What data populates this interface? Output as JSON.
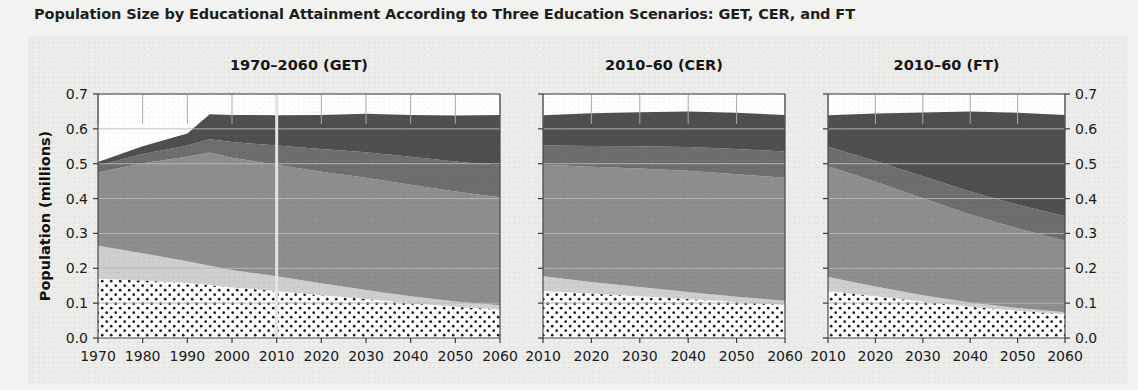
{
  "figure": {
    "title": "Population Size by Educational Attainment According to Three Education Scenarios: GET, CER, and FT"
  },
  "axes": {
    "ylabel": "Population (millions)",
    "ytick_labels": [
      "0.0",
      "0.1",
      "0.2",
      "0.3",
      "0.4",
      "0.5",
      "0.6",
      "0.7"
    ],
    "ytick_values": [
      0.0,
      0.1,
      0.2,
      0.3,
      0.4,
      0.5,
      0.6,
      0.7
    ],
    "panel1_xticks": [
      "1970",
      "1980",
      "1990",
      "2000",
      "2010",
      "2020",
      "2030",
      "2040",
      "2050",
      "2060"
    ],
    "panel2_xticks": [
      "2010",
      "2020",
      "2030",
      "2040",
      "2050",
      "2060"
    ],
    "panel3_xticks": [
      "2010",
      "2020",
      "2030",
      "2040",
      "2050",
      "2060"
    ]
  },
  "chart_data": {
    "type": "area",
    "title": "Population Size by Educational Attainment According to Three Education Scenarios: GET, CER, and FT",
    "xlabel": "",
    "ylabel": "Population (millions)",
    "ylim": [
      0.0,
      0.7
    ],
    "grid": true,
    "stacked": true,
    "legend_position": "none",
    "series_names": [
      "No education",
      "Primary",
      "Secondary",
      "Post-secondary",
      "Tertiary"
    ],
    "series_colors": [
      "#ffffff",
      "#cfcfcf",
      "#8e8e8e",
      "#6e6e6e",
      "#4f4f4f"
    ],
    "panels": [
      {
        "name": "panel-get",
        "title": "1970–2060 (GET)",
        "xlim": [
          1970,
          2060
        ],
        "reference_line_x": 2010,
        "x": [
          1970,
          1980,
          1990,
          1995,
          2000,
          2010,
          2020,
          2030,
          2040,
          2050,
          2060
        ],
        "series": [
          {
            "name": "No education",
            "values": [
              0.17,
              0.165,
              0.158,
              0.152,
              0.145,
              0.135,
              0.123,
              0.112,
              0.1,
              0.09,
              0.082
            ]
          },
          {
            "name": "Primary",
            "values": [
              0.095,
              0.078,
              0.062,
              0.055,
              0.05,
              0.042,
              0.034,
              0.026,
              0.02,
              0.015,
              0.012
            ]
          },
          {
            "name": "Secondary",
            "values": [
              0.21,
              0.258,
              0.3,
              0.325,
              0.322,
              0.32,
              0.32,
              0.322,
              0.32,
              0.315,
              0.31
            ]
          },
          {
            "name": "Post-secondary",
            "values": [
              0.02,
              0.027,
              0.032,
              0.038,
              0.045,
              0.055,
              0.065,
              0.073,
              0.08,
              0.086,
              0.09
            ]
          },
          {
            "name": "Tertiary",
            "values": [
              0.01,
              0.022,
              0.035,
              0.072,
              0.078,
              0.087,
              0.098,
              0.11,
              0.12,
              0.132,
              0.146
            ]
          }
        ],
        "totals": [
          0.505,
          0.55,
          0.587,
          0.642,
          0.64,
          0.639,
          0.64,
          0.643,
          0.64,
          0.638,
          0.64
        ]
      },
      {
        "name": "panel-cer",
        "title": "2010–60 (CER)",
        "xlim": [
          2010,
          2060
        ],
        "x": [
          2010,
          2020,
          2030,
          2040,
          2050,
          2060
        ],
        "series": [
          {
            "name": "No education",
            "values": [
              0.135,
              0.128,
              0.12,
              0.112,
              0.103,
              0.095
            ]
          },
          {
            "name": "Primary",
            "values": [
              0.042,
              0.033,
              0.026,
              0.02,
              0.015,
              0.012
            ]
          },
          {
            "name": "Secondary",
            "values": [
              0.32,
              0.33,
              0.34,
              0.348,
              0.352,
              0.353
            ]
          },
          {
            "name": "Post-secondary",
            "values": [
              0.055,
              0.06,
              0.064,
              0.068,
              0.072,
              0.075
            ]
          },
          {
            "name": "Tertiary",
            "values": [
              0.087,
              0.094,
              0.098,
              0.102,
              0.104,
              0.105
            ]
          }
        ],
        "totals": [
          0.639,
          0.645,
          0.648,
          0.65,
          0.646,
          0.64
        ]
      },
      {
        "name": "panel-ft",
        "title": "2010–60 (FT)",
        "xlim": [
          2010,
          2060
        ],
        "x": [
          2010,
          2020,
          2030,
          2040,
          2050,
          2060
        ],
        "series": [
          {
            "name": "No education",
            "values": [
              0.135,
              0.12,
              0.105,
              0.09,
              0.078,
              0.068
            ]
          },
          {
            "name": "Primary",
            "values": [
              0.04,
              0.028,
              0.018,
              0.012,
              0.008,
              0.006
            ]
          },
          {
            "name": "Secondary",
            "values": [
              0.318,
              0.3,
              0.278,
              0.252,
              0.228,
              0.205
            ]
          },
          {
            "name": "Post-secondary",
            "values": [
              0.056,
              0.06,
              0.063,
              0.066,
              0.068,
              0.07
            ]
          },
          {
            "name": "Tertiary",
            "values": [
              0.09,
              0.136,
              0.183,
              0.23,
              0.264,
              0.291
            ]
          }
        ],
        "totals": [
          0.639,
          0.644,
          0.647,
          0.65,
          0.646,
          0.64
        ]
      }
    ]
  }
}
